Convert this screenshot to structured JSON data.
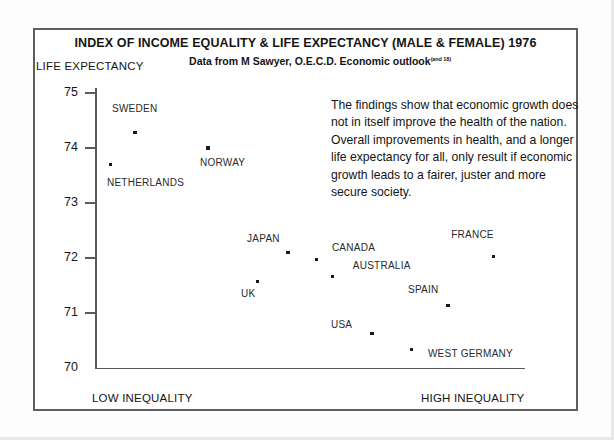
{
  "chart_data": {
    "type": "scatter",
    "title": "INDEX OF INCOME EQUALITY & LIFE EXPECTANCY (MALE & FEMALE) 1976",
    "subtitle": "Data from M Sawyer, O.E.C.D. Economic outlook",
    "subtitle_superscript": "(and 18)",
    "ylabel": "LIFE EXPECTANCY",
    "xlabel": "",
    "xlim_low_label": "LOW INEQUALITY",
    "xlim_high_label": "HIGH INEQUALITY",
    "ylim": [
      70,
      75
    ],
    "yticks": [
      75,
      74,
      73,
      72,
      71,
      70
    ],
    "grid": false,
    "legend": "none",
    "annotation": "The findings show that economic growth does not in itself improve the health of the nation. Overall improvements in health, and a longer life expectancy for all, only result if economic growth leads to a fairer, juster and more secure society.",
    "points": [
      {
        "label": "SWEDEN",
        "x": 0.093,
        "y": 74.28,
        "label_dx": -23,
        "label_dy": -24
      },
      {
        "label": "NETHERLANDS",
        "x": 0.037,
        "y": 73.7,
        "label_dx": -4,
        "label_dy": 18
      },
      {
        "label": "NORWAY",
        "x": 0.263,
        "y": 74.0,
        "label_dx": -8,
        "label_dy": 15
      },
      {
        "label": "JAPAN",
        "x": 0.449,
        "y": 72.1,
        "label_dx": -41,
        "label_dy": -14
      },
      {
        "label": "UK",
        "x": 0.377,
        "y": 71.57,
        "label_dx": -16,
        "label_dy": 12
      },
      {
        "label": "CANADA",
        "x": 0.516,
        "y": 71.98,
        "label_dx": 15,
        "label_dy": -11
      },
      {
        "label": "AUSTRALIA",
        "x": 0.553,
        "y": 71.67,
        "label_dx": 20,
        "label_dy": -10
      },
      {
        "label": "FRANCE",
        "x": 0.926,
        "y": 72.02,
        "label_dx": -42,
        "label_dy": -22
      },
      {
        "label": "SPAIN",
        "x": 0.821,
        "y": 71.14,
        "label_dx": -40,
        "label_dy": -15
      },
      {
        "label": "USA",
        "x": 0.644,
        "y": 70.62,
        "label_dx": -41,
        "label_dy": -9
      },
      {
        "label": "WEST GERMANY",
        "x": 0.737,
        "y": 70.33,
        "label_dx": 16,
        "label_dy": 4
      }
    ]
  }
}
